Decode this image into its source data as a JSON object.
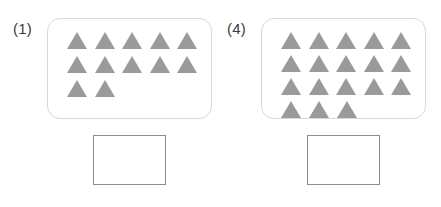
{
  "page": {
    "type": "math-worksheet",
    "background_color": "#ffffff",
    "triangle_color": "#9a9a9a",
    "panel_border_color": "#d8d8dc",
    "answer_box_border_color": "#8c8c92"
  },
  "items": [
    {
      "label": "(1)",
      "shape": "triangle",
      "total_count": 12,
      "rows": [
        5,
        5,
        2
      ],
      "answer_box_value": "",
      "answer_box_placeholder": ""
    },
    {
      "label": "(4)",
      "shape": "triangle",
      "total_count": 18,
      "rows": [
        5,
        5,
        5,
        3
      ],
      "answer_box_value": "",
      "answer_box_placeholder": ""
    }
  ]
}
